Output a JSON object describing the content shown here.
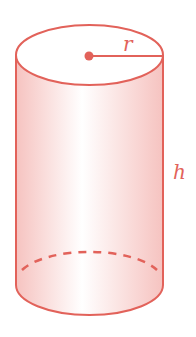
{
  "diagram": {
    "shape": "cylinder",
    "labels": {
      "radius": "r",
      "height": "h"
    },
    "colors": {
      "stroke": "#e2625a",
      "fill_edge": "#f7c9c6",
      "fill_center": "#ffffff"
    }
  }
}
